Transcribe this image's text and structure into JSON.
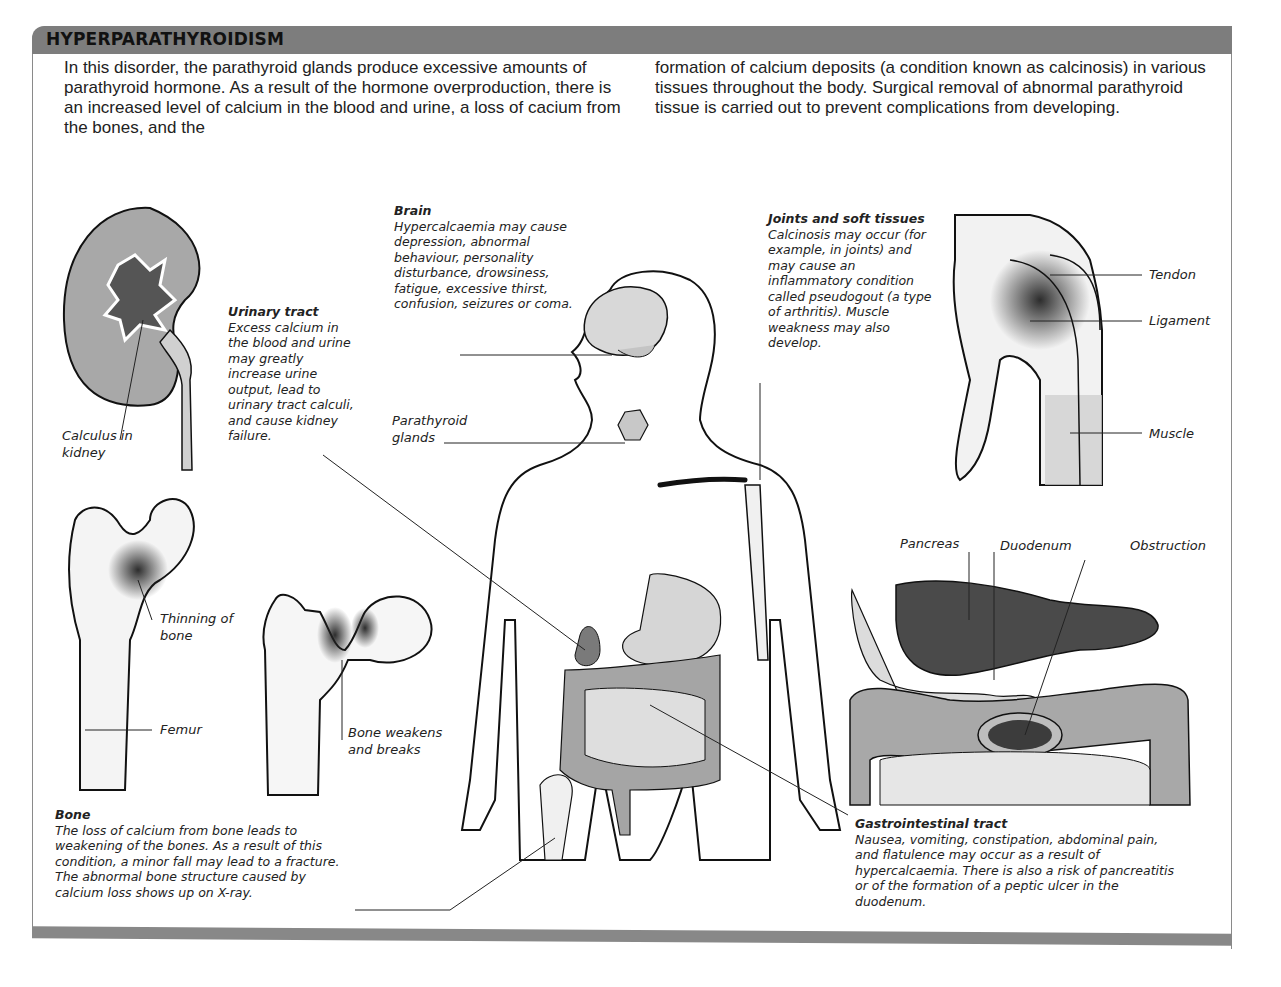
{
  "header": {
    "title": "HYPERPARATHYROIDISM"
  },
  "intro": {
    "left": "In this disorder, the parathyroid glands produce excessive amounts of parathyroid hormone. As a result of the hormone overproduction, there is an increased level of calcium in the blood and urine, a loss of cacium from the bones, and the",
    "right": "formation of calcium deposits (a condition known as calcinosis) in various tissues throughout the body. Surgical removal of abnormal parathyroid tissue is carried out to prevent complications from developing."
  },
  "captions": {
    "brain": {
      "title": "Brain",
      "text": "Hypercalcaemia may cause depression, abnormal behaviour, personality disturbance, drowsiness, fatigue, excessive thirst, confusion, seizures or coma."
    },
    "joints": {
      "title": "Joints and soft tissues",
      "text": "Calcinosis may occur (for example, in joints) and may cause an inflammatory condition called pseudogout (a type of arthritis). Muscle weakness may also develop."
    },
    "urinary": {
      "title": "Urinary tract",
      "text": "Excess calcium in the blood and urine may greatly increase urine output, lead to urinary tract calculi, and cause kidney failure."
    },
    "bone": {
      "title": "Bone",
      "text": "The loss of calcium from bone leads to weakening of the bones. As a result of this condition, a minor fall may lead to a fracture. The abnormal bone structure caused by calcium loss shows up on X-ray."
    },
    "gi": {
      "title": "Gastrointestinal tract",
      "text": "Nausea, vomiting, constipation, abdominal pain, and flatulence may occur as a result of hypercalcaemia. There is also a risk of pancreatitis or of the formation of a peptic ulcer in the duodenum."
    }
  },
  "labels": {
    "parathyroid": "Parathyroid glands",
    "calculus": "Calculus in kidney",
    "thinning": "Thinning of bone",
    "femur": "Femur",
    "bone_breaks": "Bone weakens and breaks",
    "tendon": "Tendon",
    "ligament": "Ligament",
    "muscle": "Muscle",
    "pancreas": "Pancreas",
    "duodenum": "Duodenum",
    "obstruction": "Obstruction"
  },
  "colors": {
    "header_bar": "#7d7d7d",
    "organ_dark": "#4a4a4a",
    "organ_mid": "#9a9a9a",
    "organ_light": "#d6d6d6"
  }
}
